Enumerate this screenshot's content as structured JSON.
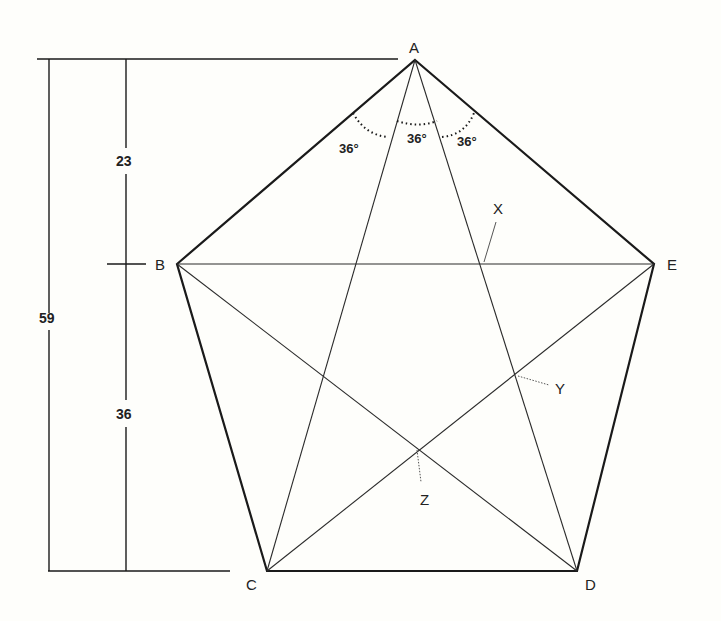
{
  "diagram": {
    "vertices": {
      "A": {
        "label": "A",
        "x": 415,
        "y": 60
      },
      "B": {
        "label": "B",
        "x": 177,
        "y": 264
      },
      "C": {
        "label": "C",
        "x": 267,
        "y": 571
      },
      "D": {
        "label": "D",
        "x": 577,
        "y": 571
      },
      "E": {
        "label": "E",
        "x": 654,
        "y": 264
      }
    },
    "points": {
      "X": {
        "label": "X"
      },
      "Y": {
        "label": "Y"
      },
      "Z": {
        "label": "Z"
      }
    },
    "angles": [
      {
        "label": "36°"
      },
      {
        "label": "36°"
      },
      {
        "label": "36°"
      }
    ],
    "dimensions": {
      "upper": "23",
      "lower": "36",
      "total": "59"
    },
    "colors": {
      "stroke": "#1a1a1a",
      "background": "#fefefb"
    }
  }
}
